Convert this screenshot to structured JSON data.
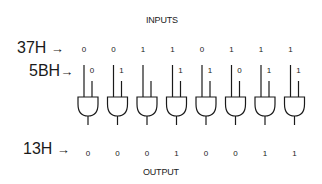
{
  "header": {
    "title": "INPUTS"
  },
  "footer": {
    "title": "OUTPUT"
  },
  "rows": {
    "input_a": {
      "label": "37H",
      "arrow": "→",
      "bits": [
        "0",
        "0",
        "1",
        "1",
        "0",
        "1",
        "1",
        "1"
      ]
    },
    "input_b": {
      "label": "5BH",
      "arrow": "→",
      "bits": [
        "0",
        "1",
        "",
        "1",
        "1",
        "0",
        "1",
        "1"
      ]
    },
    "output": {
      "label": "13H",
      "arrow": "→",
      "bits": [
        "0",
        "0",
        "0",
        "1",
        "0",
        "0",
        "1",
        "1"
      ]
    }
  },
  "gate_type": "AND",
  "gate_count": 8,
  "line_color": "#1a1a1a"
}
